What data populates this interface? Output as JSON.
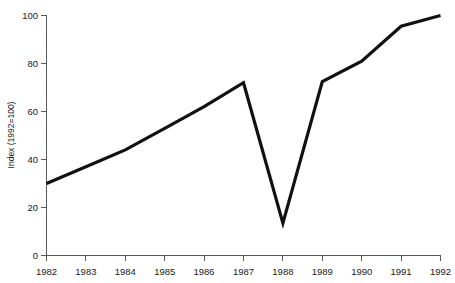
{
  "chart_data": {
    "type": "line",
    "title": "",
    "subtitle": "",
    "xlabel": "",
    "ylabel": "Index (1992=100)",
    "categories": [
      "1982",
      "1983",
      "1984",
      "1985",
      "1986",
      "1987",
      "1988",
      "1989",
      "1990",
      "1991",
      "1992"
    ],
    "x": [
      1982,
      1983,
      1984,
      1985,
      1986,
      1987,
      1988,
      1989,
      1990,
      1991,
      1992
    ],
    "values": [
      30,
      37,
      44,
      53,
      62,
      72,
      13.5,
      72.5,
      81,
      95.5,
      100
    ],
    "series": [
      {
        "name": "Index (1992=100)",
        "values": [
          30,
          37,
          44,
          53,
          62,
          72,
          13.5,
          72.5,
          81,
          95.5,
          100
        ]
      }
    ],
    "xlim": [
      1982,
      1992
    ],
    "ylim": [
      0,
      100
    ],
    "yticks": [
      0,
      20,
      40,
      60,
      80,
      100
    ],
    "ytick_labels": [
      "0",
      "20",
      "40",
      "60",
      "80",
      "100"
    ],
    "xticks": [
      1982,
      1983,
      1984,
      1985,
      1986,
      1987,
      1988,
      1989,
      1990,
      1991,
      1992
    ],
    "xtick_labels": [
      "1982",
      "1983",
      "1984",
      "1985",
      "1986",
      "1987",
      "1988",
      "1989",
      "1990",
      "1991",
      "1992"
    ],
    "grid": false,
    "legend": false,
    "legend_position": "none",
    "annotations": [],
    "colors": {
      "line": "#111111",
      "axis": "#59595b",
      "text": "#1a1a1a",
      "background": "#ffffff"
    }
  }
}
